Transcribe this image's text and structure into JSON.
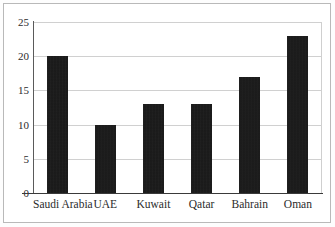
{
  "chart_data": {
    "type": "bar",
    "title": "",
    "subtitle": "",
    "xlabel": "",
    "ylabel": "",
    "categories": [
      "Saudi Arabia",
      "UAE",
      "Kuwait",
      "Qatar",
      "Bahrain",
      "Oman"
    ],
    "values": [
      20,
      10,
      13,
      13,
      17,
      23
    ],
    "ylim": [
      0,
      25
    ],
    "yticks": [
      0,
      5,
      10,
      15,
      20,
      25
    ],
    "ytick_labels": [
      "0",
      "5",
      "10",
      "15",
      "20",
      "25"
    ],
    "grid": true,
    "grid_axis": "y",
    "legend": false,
    "legend_position": "none",
    "annotations": [],
    "colors": {
      "bar": "#151515",
      "gridline": "#d0d0d0",
      "axis": "#3a3a3a",
      "text": "#2b2b2b",
      "frame": "#b9b9b9",
      "background": "#ffffff"
    }
  }
}
